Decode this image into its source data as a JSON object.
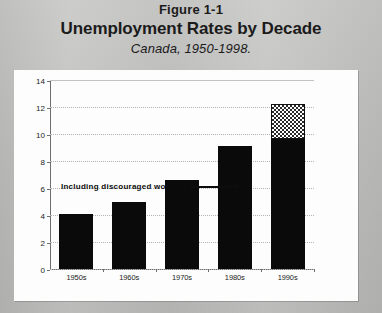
{
  "figure": {
    "number": "Figure 1-1",
    "title": "Unemployment Rates by Decade",
    "subtitle": "Canada, 1950-1998."
  },
  "annotation": {
    "text": "Including discouraged workers",
    "arrow_icon": "arrow-right-icon",
    "points_to": "1990s"
  },
  "colors": {
    "page_background": "#c6c6c4",
    "panel_background": "#fdfdfd",
    "bar_fill": "#0a0a0a",
    "hatch_fill": "#2a2a2a",
    "axis": "#6d6d6d",
    "gridline": "#b4b4b4",
    "text": "#1b1b1b"
  },
  "chart_data": {
    "type": "bar",
    "title": "Unemployment Rates by Decade",
    "subtitle": "Canada, 1950-1998.",
    "xlabel": "",
    "ylabel": "",
    "ylim": [
      0,
      14
    ],
    "yticks": [
      0,
      2,
      4,
      6,
      8,
      10,
      12,
      14
    ],
    "grid": true,
    "legend": false,
    "categories": [
      "1950s",
      "1960s",
      "1970s",
      "1980s",
      "1990s"
    ],
    "series": [
      {
        "name": "Unemployment rate",
        "values": [
          4.1,
          5.0,
          6.6,
          9.1,
          9.6
        ]
      },
      {
        "name": "Including discouraged workers",
        "values": [
          0,
          0,
          0,
          0,
          2.6
        ]
      }
    ],
    "stacked": true,
    "totals": [
      4.1,
      5.0,
      6.6,
      9.1,
      12.2
    ],
    "annotations": [
      {
        "text": "Including discouraged workers",
        "target_category": "1990s",
        "target_value": 11.0
      }
    ]
  }
}
